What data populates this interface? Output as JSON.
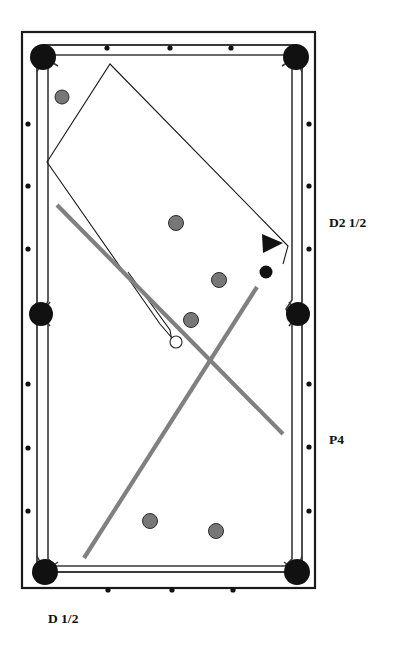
{
  "diagram": {
    "type": "billiards-table-shot-diagram",
    "canvas": {
      "width": 397,
      "height": 652,
      "background": "#ffffff"
    },
    "colors": {
      "frame_stroke": "#1a1a1a",
      "rail_stroke": "#3a3a3a",
      "pocket_fill": "#111111",
      "ball_object_fill": "#777777",
      "ball_object_stroke": "#2b2b2b",
      "ball_black_fill": "#111111",
      "cue_ball_fill": "#ffffff",
      "cue_ball_stroke": "#333333",
      "path_thin_stroke": "#1a1a1a",
      "path_thick_stroke": "#808080",
      "diamond_fill": "#111111",
      "text_color": "#111111"
    },
    "labels": [
      {
        "id": "label-d2-half",
        "text": "D2 1/2",
        "x": 329,
        "y": 222,
        "anchor": "start"
      },
      {
        "id": "label-p4",
        "text": "P4",
        "x": 329,
        "y": 439,
        "anchor": "start"
      },
      {
        "id": "label-d-half",
        "text": "D 1/2",
        "x": 48,
        "y": 620,
        "anchor": "start"
      }
    ],
    "frame": {
      "x": 22,
      "y": 32,
      "width": 293,
      "height": 556
    },
    "rails": {
      "outer": {
        "x": 32,
        "y": 42,
        "width": 273,
        "height": 536
      },
      "inner": {
        "x": 40,
        "y": 50,
        "width": 257,
        "height": 520
      }
    },
    "pockets": [
      {
        "id": "pocket-top-left",
        "cx": 43,
        "cy": 57,
        "r": 13
      },
      {
        "id": "pocket-top-right",
        "cx": 296,
        "cy": 57,
        "r": 13
      },
      {
        "id": "pocket-side-left",
        "cx": 41,
        "cy": 314,
        "r": 12
      },
      {
        "id": "pocket-side-right",
        "cx": 298,
        "cy": 314,
        "r": 12
      },
      {
        "id": "pocket-bottom-left",
        "cx": 45,
        "cy": 572,
        "r": 13
      },
      {
        "id": "pocket-bottom-right",
        "cx": 297,
        "cy": 572,
        "r": 13
      }
    ],
    "diamonds": {
      "radius": 2.6,
      "top": [
        {
          "x": 107,
          "y": 48
        },
        {
          "x": 170,
          "y": 48
        },
        {
          "x": 231,
          "y": 48
        }
      ],
      "bottom": [
        {
          "x": 108,
          "y": 590
        },
        {
          "x": 172,
          "y": 590
        },
        {
          "x": 233,
          "y": 590
        }
      ],
      "left": [
        {
          "x": 28,
          "y": 124
        },
        {
          "x": 28,
          "y": 186
        },
        {
          "x": 28,
          "y": 249
        },
        {
          "x": 28,
          "y": 384
        },
        {
          "x": 28,
          "y": 448
        },
        {
          "x": 28,
          "y": 511
        }
      ],
      "right": [
        {
          "x": 309,
          "y": 124
        },
        {
          "x": 309,
          "y": 186
        },
        {
          "x": 309,
          "y": 249
        },
        {
          "x": 309,
          "y": 384
        },
        {
          "x": 309,
          "y": 447
        },
        {
          "x": 309,
          "y": 511
        }
      ]
    },
    "balls": [
      {
        "id": "ball-object-1",
        "kind": "object",
        "cx": 62,
        "cy": 97,
        "r": 7
      },
      {
        "id": "ball-object-2",
        "kind": "object",
        "cx": 176,
        "cy": 223,
        "r": 7.5
      },
      {
        "id": "ball-object-3",
        "kind": "object",
        "cx": 219,
        "cy": 280,
        "r": 7.5
      },
      {
        "id": "ball-object-4",
        "kind": "object",
        "cx": 191,
        "cy": 320,
        "r": 7.5
      },
      {
        "id": "ball-object-5",
        "kind": "object",
        "cx": 150,
        "cy": 521,
        "r": 7.5
      },
      {
        "id": "ball-object-6",
        "kind": "object",
        "cx": 216,
        "cy": 531,
        "r": 7.5
      },
      {
        "id": "ball-black",
        "kind": "black",
        "cx": 266,
        "cy": 272,
        "r": 6.5
      },
      {
        "id": "ball-cue",
        "kind": "cue",
        "cx": 176,
        "cy": 342,
        "r": 6
      }
    ],
    "thin_path": {
      "id": "cue-ball-rail-path",
      "points": "172,338 160,324 47,162 110,64 288,246 283,264",
      "closed": false
    },
    "thin_path_secondary": {
      "id": "cue-ball-return-path",
      "points": "172,342 170,330 128,272"
    },
    "arrow": {
      "id": "direction-arrow",
      "points": "262,234 282,243 264,253",
      "tip_x": 282,
      "tip_y": 243
    },
    "thick_lines": [
      {
        "id": "aim-line-1",
        "x1": 57,
        "y1": 205,
        "x2": 283,
        "y2": 434,
        "width": 4.2
      },
      {
        "id": "aim-line-2",
        "x1": 257,
        "y1": 287,
        "x2": 84,
        "y2": 558,
        "width": 4.2
      }
    ]
  }
}
